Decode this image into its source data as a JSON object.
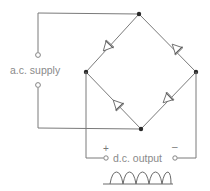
{
  "diagram": {
    "labels": {
      "ac_supply": "a.c. supply",
      "dc_output": "d.c. output",
      "positive": "+",
      "negative": "–"
    },
    "nodes": {
      "top": [
        139,
        14
      ],
      "left": [
        86,
        72
      ],
      "right": [
        196,
        72
      ],
      "bottom": [
        141,
        129
      ]
    },
    "components": [
      {
        "type": "diode",
        "between": [
          "left",
          "top"
        ]
      },
      {
        "type": "diode",
        "between": [
          "right",
          "top"
        ]
      },
      {
        "type": "diode",
        "between": [
          "bottom",
          "left"
        ]
      },
      {
        "type": "diode",
        "between": [
          "bottom",
          "right"
        ]
      }
    ],
    "terminals": {
      "ac_top": [
        38,
        55
      ],
      "ac_bottom": [
        38,
        85
      ],
      "dc_positive": [
        106,
        158
      ],
      "dc_negative": [
        175,
        158
      ]
    },
    "waveform": {
      "type": "full-wave rectified",
      "humps": 5
    },
    "colors": {
      "wire": "#7a7a7a",
      "node": "#2a2a2a",
      "text": "#8a8a8a"
    }
  }
}
